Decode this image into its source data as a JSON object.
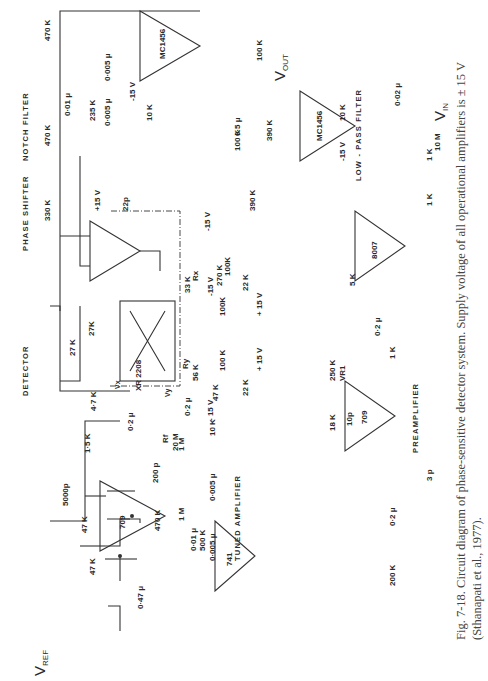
{
  "sections": {
    "phase_shifter": "PHASE SHIFTER",
    "detector": "DETECTOR",
    "notch_filter": "NOTCH FILTER",
    "low_pass_filter": "LOW - PASS FILTER",
    "preamplifier": "PREAMPLIFIER",
    "tuned_amplifier": "TUNED AMPLIFIER"
  },
  "terminals": {
    "vref": "V",
    "vref_sub": "REF",
    "vin": "V",
    "vin_sub": "IN",
    "vout": "V",
    "vout_sub": "OUT"
  },
  "opamps": {
    "phase_shifter": "709",
    "tuned_amp": "741",
    "detector_amp": "XR 2208",
    "preamp_1": "709",
    "preamp_2": "8007",
    "notch": "MC1456",
    "lowpass": "MC1456"
  },
  "components": {
    "ps_r_in": "47 K",
    "ps_r_gnd": "47 K",
    "ps_c_in": "0·47 μ",
    "ps_pot": "470 K",
    "ps_c_comp": "5000p",
    "ps_r_comp": "1·5 K",
    "ps_c_out": "200 p",
    "det_c_in": "0·2 μ",
    "det_r_vx": "4·7 K",
    "det_r1": "27 K",
    "det_r2": "27K",
    "det_rx_label": "Rx",
    "det_rx": "33 K",
    "det_ry_label": "Ry",
    "det_ry": "56 K",
    "det_r_off1": "100K",
    "det_r_off2": "100 K",
    "det_pot1": "22 K",
    "det_pot2": "22 K",
    "det_v_pos1": "+ 15 V",
    "det_v_pos2": "+ 15 V",
    "det_v_neg1": "-15 V",
    "det_v_neg2": "- 15 V",
    "xr_v_pos": "+15 V",
    "xr_c": "22p",
    "xr_r": "270 K",
    "xr_pot": "100K",
    "xr_v_neg": "-15 V",
    "notch_r_in": "330 K",
    "notch_r1": "470 K",
    "notch_r2": "470 K",
    "notch_c1": "0·01 μ",
    "notch_r3": "235 K",
    "notch_c2": "0·005 μ",
    "notch_c3": "0·005 μ",
    "notch_pot": "10 K",
    "notch_v": "-15 V",
    "notch_rf": "100 K",
    "notch_r_out": "100 K",
    "lp_r_in": "390 K",
    "lp_r_fb": "390 K",
    "lp_c_fb": "0·5 μ",
    "lp_pot": "10 K",
    "lp_v": "-15 V",
    "ta_rf_label": "Rf",
    "ta_rf": "20 M",
    "ta_r1": "1 M",
    "ta_r2": "1 M",
    "ta_c1": "0·01 μ",
    "ta_r3": "500 K",
    "ta_c2": "0·005 μ",
    "ta_c3": "0·005 μ",
    "ta_c_in": "0·2 μ",
    "ta_pot": "10 K",
    "ta_r_gnd": "47 K",
    "pa_r_in": "200 K",
    "pa_c_in": "0·2 μ",
    "pa_r_fb1": "18 K",
    "pa_pot": "250 K",
    "pa_pot_label": "VR1",
    "pa_c_comp": "10p",
    "pa_c_out": "3 p",
    "pa_r_link": "1 K",
    "pa_c_link": "0·2 μ",
    "pa_r_fb2": "5 K",
    "pa_r_a": "1 K",
    "pa_r_b": "1 K",
    "in_r": "10 M",
    "in_c": "0·02 μ"
  },
  "pins": {
    "p1": "1",
    "p2": "2",
    "p3": "3",
    "p4": "4",
    "p5": "5",
    "p6": "6",
    "p7": "7",
    "p8": "8",
    "p9": "9",
    "p10": "10",
    "p11": "11",
    "p12": "12",
    "p13": "13",
    "p14": "14",
    "p16": "16",
    "vx": "Vx",
    "vy": "Vy",
    "minus": "-",
    "plus": "+"
  },
  "caption": {
    "fig_label": "Fig. 7-18.",
    "text": "Circuit diagram of phase-sensitive detector system. Supply voltage of all operational amplifiers is ± 15 V (Sthanapati et al., 1977)."
  }
}
